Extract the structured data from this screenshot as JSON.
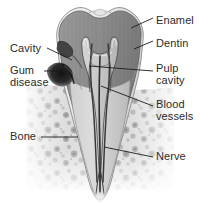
{
  "figure": {
    "width": 200,
    "height": 204,
    "background_color": "#ffffff",
    "label_color": "#2b2b2b",
    "leader_color": "#1c1c1c"
  },
  "labels": {
    "enamel": "Enamel",
    "dentin": "Dentin",
    "pulp_cavity_line1": "Pulp",
    "pulp_cavity_line2": "cavity",
    "blood_vessels_line1": "Blood",
    "blood_vessels_line2": "vessels",
    "nerve": "Nerve",
    "cavity": "Cavity",
    "gum_disease_line1": "Gum",
    "gum_disease_line2": "disease",
    "bone": "Bone"
  },
  "annotations": [
    {
      "id": "enamel",
      "side": "right",
      "text": "Enamel",
      "x": 156,
      "y": 15
    },
    {
      "id": "dentin",
      "side": "right",
      "text": "Dentin",
      "x": 156,
      "y": 38
    },
    {
      "id": "pulp-cavity",
      "side": "right",
      "text": "Pulp cavity",
      "x": 156,
      "y": 63
    },
    {
      "id": "blood-vessels",
      "side": "right",
      "text": "Blood vessels",
      "x": 156,
      "y": 99
    },
    {
      "id": "nerve",
      "side": "right",
      "text": "Nerve",
      "x": 156,
      "y": 154
    },
    {
      "id": "cavity",
      "side": "left",
      "text": "Cavity",
      "x": 10,
      "y": 43
    },
    {
      "id": "gum-disease",
      "side": "left",
      "text": "Gum disease",
      "x": 10,
      "y": 66
    },
    {
      "id": "bone",
      "side": "left",
      "text": "Bone",
      "x": 10,
      "y": 132
    }
  ],
  "anatomy": {
    "structures": [
      "enamel",
      "dentin",
      "pulp cavity",
      "blood vessels",
      "nerve",
      "cavity",
      "gum disease",
      "bone"
    ],
    "colors": {
      "enamel": "#e9e9e9",
      "dentin": "#8f8f8f",
      "pulp": "#c9c9c9",
      "bone": "#d8d8d8",
      "gum_disease": "#2a2a2a",
      "outline": "#6b6b6b"
    }
  }
}
